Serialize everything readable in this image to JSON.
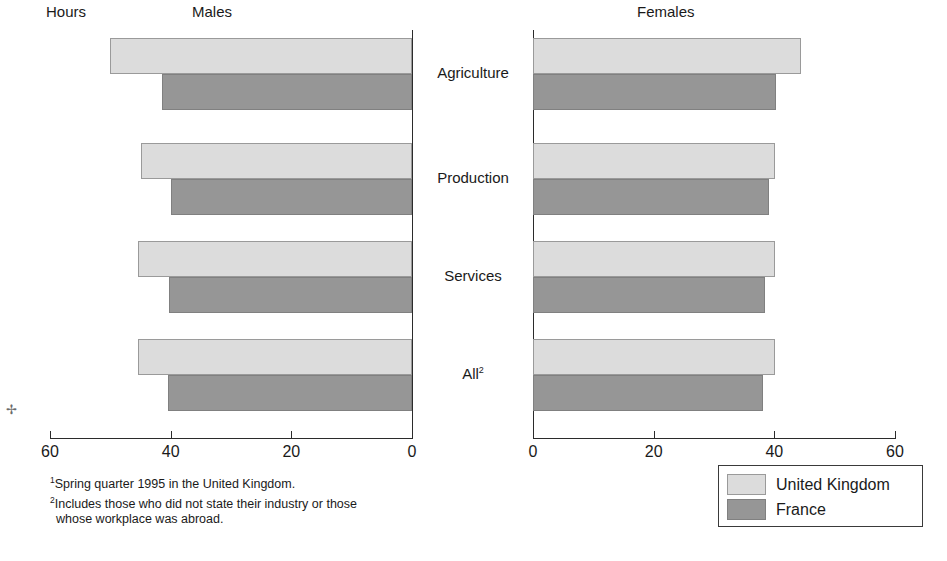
{
  "headers": {
    "units": "Hours",
    "left_panel": "Males",
    "right_panel": "Females"
  },
  "categories": [
    {
      "label": "Agriculture",
      "footnote_marker": ""
    },
    {
      "label": "Production",
      "footnote_marker": ""
    },
    {
      "label": "Services",
      "footnote_marker": ""
    },
    {
      "label": "All",
      "footnote_marker": "2"
    }
  ],
  "axis": {
    "ticks_left": [
      "60",
      "40",
      "20",
      "0"
    ],
    "ticks_right": [
      "0",
      "20",
      "40",
      "60"
    ],
    "min": 0,
    "max": 60
  },
  "legend": {
    "items": [
      {
        "label": "United Kingdom",
        "color": "#dcdcdc",
        "key": "uk"
      },
      {
        "label": "France",
        "color": "#969696",
        "key": "fr"
      }
    ]
  },
  "footnotes": [
    {
      "marker": "1",
      "text": "Spring quarter 1995 in the United Kingdom.",
      "indent": false
    },
    {
      "marker": "2",
      "text": "Includes those who did not state their industry or those",
      "indent": false
    },
    {
      "marker": "",
      "text": "whose workplace was abroad.",
      "indent": true
    }
  ],
  "colors": {
    "united_kingdom": "#dcdcdc",
    "france": "#969696",
    "axis": "#2b2b2b",
    "background": "#ffffff"
  },
  "chart_data": {
    "type": "bar",
    "title": "",
    "subtitle": "",
    "xlabel": "Hours",
    "ylabel": "",
    "orientation": "horizontal",
    "layout": "bidirectional-pyramid",
    "panels": [
      "Males",
      "Females"
    ],
    "categories": [
      "Agriculture",
      "Production",
      "Services",
      "All"
    ],
    "xlim": [
      0,
      60
    ],
    "xticks": [
      0,
      20,
      40,
      60
    ],
    "grid": false,
    "legend_position": "bottom-right",
    "series": [
      {
        "name": "United Kingdom",
        "color": "#dcdcdc",
        "panels": {
          "Males": [
            50.1,
            44.9,
            45.4,
            45.4
          ],
          "Females": [
            44.4,
            40.1,
            40.1,
            40.1
          ]
        }
      },
      {
        "name": "France",
        "color": "#969696",
        "panels": {
          "Males": [
            41.4,
            39.9,
            40.3,
            40.5
          ],
          "Females": [
            40.3,
            39.1,
            38.4,
            38.2
          ]
        }
      }
    ]
  }
}
